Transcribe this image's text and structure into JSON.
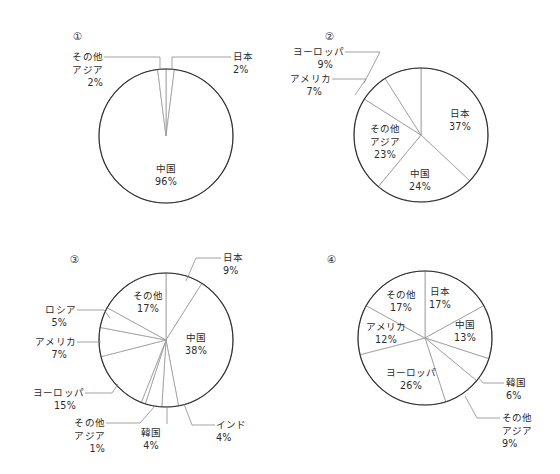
{
  "figure": {
    "background_color": "#ffffff",
    "outline_color": "#2e2e2e",
    "slice_line_color": "#9a9a9a",
    "leader_color": "#8c8c8c",
    "text_color": "#2b2b2b",
    "panel_labels": [
      "①",
      "②",
      "③",
      "④"
    ]
  },
  "chart_data": [
    {
      "type": "pie",
      "title": "①",
      "categories": [
        "日本",
        "中国",
        "その他アジア"
      ],
      "values": [
        2,
        96,
        2
      ],
      "labels": [
        {
          "name": "日本",
          "percent": "2%",
          "lines": [
            "日本",
            "2%"
          ]
        },
        {
          "name": "中国",
          "percent": "96%",
          "lines": [
            "中国",
            "96%"
          ]
        },
        {
          "name": "その他アジア",
          "percent": "2%",
          "lines": [
            "その他",
            "アジア",
            "2%"
          ]
        }
      ],
      "legend": "none",
      "start_angle_deg": 0,
      "direction": "clockwise"
    },
    {
      "type": "pie",
      "title": "②",
      "categories": [
        "日本",
        "中国",
        "その他アジア",
        "アメリカ",
        "ヨーロッパ"
      ],
      "values": [
        37,
        24,
        23,
        7,
        9
      ],
      "labels": [
        {
          "name": "日本",
          "percent": "37%",
          "lines": [
            "日本",
            "37%"
          ]
        },
        {
          "name": "中国",
          "percent": "24%",
          "lines": [
            "中国",
            "24%"
          ]
        },
        {
          "name": "その他アジア",
          "percent": "23%",
          "lines": [
            "その他",
            "アジア",
            "23%"
          ]
        },
        {
          "name": "アメリカ",
          "percent": "7%",
          "lines": [
            "アメリカ",
            "7%"
          ]
        },
        {
          "name": "ヨーロッパ",
          "percent": "9%",
          "lines": [
            "ヨーロッパ",
            "9%"
          ]
        }
      ],
      "legend": "none",
      "start_angle_deg": 0,
      "direction": "clockwise"
    },
    {
      "type": "pie",
      "title": "③",
      "categories": [
        "日本",
        "中国",
        "インド",
        "韓国",
        "その他アジア",
        "ヨーロッパ",
        "アメリカ",
        "ロシア",
        "その他"
      ],
      "values": [
        9,
        38,
        4,
        4,
        1,
        15,
        7,
        5,
        17
      ],
      "labels": [
        {
          "name": "日本",
          "percent": "9%",
          "lines": [
            "日本",
            "9%"
          ]
        },
        {
          "name": "中国",
          "percent": "38%",
          "lines": [
            "中国",
            "38%"
          ]
        },
        {
          "name": "インド",
          "percent": "4%",
          "lines": [
            "インド",
            "4%"
          ]
        },
        {
          "name": "韓国",
          "percent": "4%",
          "lines": [
            "韓国",
            "4%"
          ]
        },
        {
          "name": "その他アジア",
          "percent": "1%",
          "lines": [
            "その他",
            "アジア",
            "1%"
          ]
        },
        {
          "name": "ヨーロッパ",
          "percent": "15%",
          "lines": [
            "ヨーロッパ",
            "15%"
          ]
        },
        {
          "name": "アメリカ",
          "percent": "7%",
          "lines": [
            "アメリカ",
            "7%"
          ]
        },
        {
          "name": "ロシア",
          "percent": "5%",
          "lines": [
            "ロシア",
            "5%"
          ]
        },
        {
          "name": "その他",
          "percent": "17%",
          "lines": [
            "その他",
            "17%"
          ]
        }
      ],
      "legend": "none",
      "start_angle_deg": 0,
      "direction": "clockwise"
    },
    {
      "type": "pie",
      "title": "④",
      "categories": [
        "日本",
        "中国",
        "韓国",
        "その他アジア",
        "ヨーロッパ",
        "アメリカ",
        "その他"
      ],
      "values": [
        17,
        13,
        6,
        9,
        26,
        12,
        17
      ],
      "labels": [
        {
          "name": "日本",
          "percent": "17%",
          "lines": [
            "日本",
            "17%"
          ]
        },
        {
          "name": "中国",
          "percent": "13%",
          "lines": [
            "中国",
            "13%"
          ]
        },
        {
          "name": "韓国",
          "percent": "6%",
          "lines": [
            "韓国",
            "6%"
          ]
        },
        {
          "name": "その他アジア",
          "percent": "9%",
          "lines": [
            "その他",
            "アジア",
            "9%"
          ]
        },
        {
          "name": "ヨーロッパ",
          "percent": "26%",
          "lines": [
            "ヨーロッパ",
            "26%"
          ]
        },
        {
          "name": "アメリカ",
          "percent": "12%",
          "lines": [
            "アメリカ",
            "12%"
          ]
        },
        {
          "name": "その他",
          "percent": "17%",
          "lines": [
            "その他",
            "17%"
          ]
        }
      ],
      "legend": "none",
      "start_angle_deg": 0,
      "direction": "clockwise"
    }
  ],
  "text_labels": {
    "panel1": {
      "number": "①",
      "sonota_asia_l1": "その他",
      "sonota_asia_l2": "アジア",
      "sonota_asia_pct": "2%",
      "nihon_l1": "日本",
      "nihon_pct": "2%",
      "chugoku_l1": "中国",
      "chugoku_pct": "96%"
    },
    "panel2": {
      "number": "②",
      "europe_l1": "ヨーロッパ",
      "europe_pct": "9%",
      "america_l1": "アメリカ",
      "america_pct": "7%",
      "sonota_asia_l1": "その他",
      "sonota_asia_l2": "アジア",
      "sonota_asia_pct": "23%",
      "chugoku_l1": "中国",
      "chugoku_pct": "24%",
      "nihon_l1": "日本",
      "nihon_pct": "37%"
    },
    "panel3": {
      "number": "③",
      "nihon_l1": "日本",
      "nihon_pct": "9%",
      "sonota_l1": "その他",
      "sonota_pct": "17%",
      "russia_l1": "ロシア",
      "russia_pct": "5%",
      "america_l1": "アメリカ",
      "america_pct": "7%",
      "europe_l1": "ヨーロッパ",
      "europe_pct": "15%",
      "sonota_asia_l1": "その他",
      "sonota_asia_l2": "アジア",
      "sonota_asia_pct": "1%",
      "korea_l1": "韓国",
      "korea_pct": "4%",
      "india_l1": "インド",
      "india_pct": "4%",
      "chugoku_l1": "中国",
      "chugoku_pct": "38%"
    },
    "panel4": {
      "number": "④",
      "nihon_l1": "日本",
      "nihon_pct": "17%",
      "sonota_l1": "その他",
      "sonota_pct": "17%",
      "america_l1": "アメリカ",
      "america_pct": "12%",
      "europe_l1": "ヨーロッパ",
      "europe_pct": "26%",
      "chugoku_l1": "中国",
      "chugoku_pct": "13%",
      "korea_l1": "韓国",
      "korea_pct": "6%",
      "sonota_asia_l1": "その他",
      "sonota_asia_l2": "アジア",
      "sonota_asia_pct": "9%"
    }
  }
}
